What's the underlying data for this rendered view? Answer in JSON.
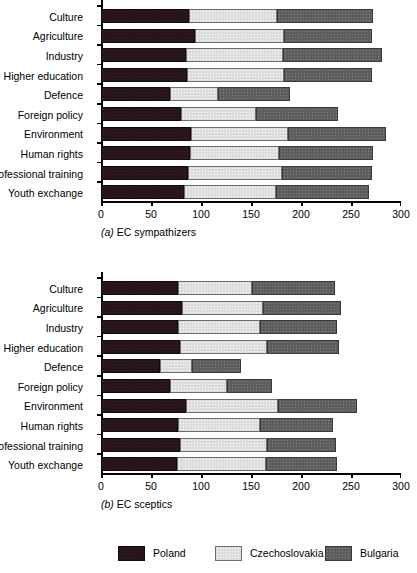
{
  "figure": {
    "background": "#ffffff",
    "colors": {
      "poland": "#261418",
      "czechoslovakia": "#dddddd",
      "bulgaria": "#5d5d5d"
    }
  },
  "legend": {
    "items": [
      {
        "label": "Poland",
        "key": "poland"
      },
      {
        "label": "Czechoslovakia",
        "key": "czechoslovakia"
      },
      {
        "label": "Bulgaria",
        "key": "bulgaria"
      }
    ]
  },
  "chart_data": [
    {
      "id": "a",
      "type": "bar",
      "orientation": "horizontal",
      "stacked": true,
      "title": "(a) EC sympathizers",
      "caption_prefix": "(a)",
      "caption_text": "EC sympathizers",
      "xlabel": "",
      "ylabel": "",
      "xlim": [
        0,
        300
      ],
      "xticks": [
        0,
        50,
        100,
        150,
        200,
        250,
        300
      ],
      "xticklabels": [
        "0",
        "50",
        "100",
        "150",
        "200",
        "250",
        "300"
      ],
      "grid": false,
      "legend_position": "bottom",
      "categories": [
        "Culture",
        "Agriculture",
        "Industry",
        "Higher education",
        "Defence",
        "Foreign policy",
        "Environment",
        "Human rights",
        "Professional training",
        "Youth exchange"
      ],
      "series": [
        {
          "name": "Poland",
          "values": [
            88,
            94,
            85,
            86,
            69,
            80,
            90,
            89,
            87,
            83
          ]
        },
        {
          "name": "Czechoslovakia",
          "values": [
            88,
            89,
            97,
            97,
            48,
            75,
            97,
            89,
            94,
            92
          ]
        },
        {
          "name": "Bulgaria",
          "values": [
            96,
            88,
            99,
            88,
            72,
            82,
            98,
            94,
            90,
            93
          ]
        }
      ],
      "totals": [
        272,
        271,
        281,
        271,
        189,
        237,
        285,
        272,
        271,
        268
      ]
    },
    {
      "id": "b",
      "type": "bar",
      "orientation": "horizontal",
      "stacked": true,
      "title": "(b) EC sceptics",
      "caption_prefix": "(b)",
      "caption_text": "EC sceptics",
      "xlabel": "",
      "ylabel": "",
      "xlim": [
        0,
        300
      ],
      "xticks": [
        0,
        50,
        100,
        150,
        200,
        250,
        300
      ],
      "xticklabels": [
        "0",
        "50",
        "100",
        "150",
        "200",
        "250",
        "300"
      ],
      "grid": false,
      "legend_position": "bottom",
      "categories": [
        "Culture",
        "Agriculture",
        "Industry",
        "Higher education",
        "Defence",
        "Foreign policy",
        "Environment",
        "Human rights",
        "Professional training",
        "Youth exchange"
      ],
      "series": [
        {
          "name": "Poland",
          "values": [
            77,
            81,
            77,
            79,
            59,
            69,
            85,
            77,
            79,
            76
          ]
        },
        {
          "name": "Czechoslovakia",
          "values": [
            74,
            81,
            82,
            87,
            32,
            57,
            92,
            82,
            87,
            89
          ]
        },
        {
          "name": "Bulgaria",
          "values": [
            83,
            78,
            77,
            72,
            49,
            45,
            79,
            73,
            69,
            71
          ]
        }
      ],
      "totals": [
        234,
        240,
        236,
        238,
        140,
        171,
        256,
        232,
        235,
        236
      ]
    }
  ]
}
